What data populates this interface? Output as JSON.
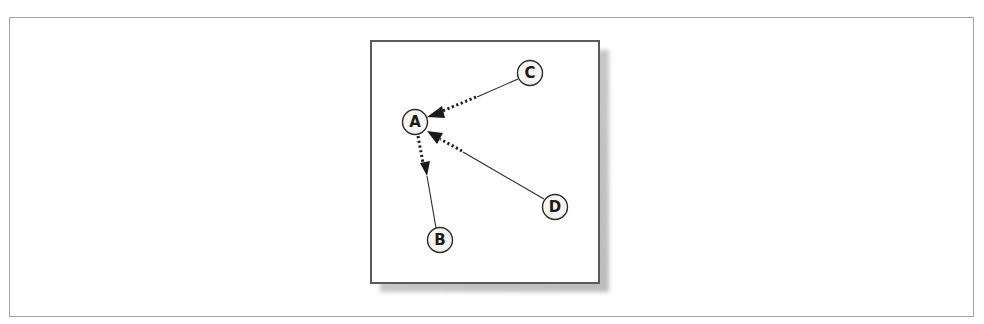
{
  "diagram": {
    "type": "directed-graph",
    "nodes": [
      {
        "id": "A",
        "label": "A",
        "cx": 415,
        "cy": 122
      },
      {
        "id": "B",
        "label": "B",
        "cx": 440,
        "cy": 240
      },
      {
        "id": "C",
        "label": "C",
        "cx": 530,
        "cy": 73
      },
      {
        "id": "D",
        "label": "D",
        "cx": 555,
        "cy": 207
      }
    ],
    "edges": [
      {
        "from": "C",
        "to": "A",
        "style": "solid-then-dotted",
        "arrow": "at A"
      },
      {
        "from": "D",
        "to": "A",
        "style": "solid-then-dotted",
        "arrow": "at A"
      },
      {
        "from": "A",
        "to": "B",
        "style": "dotted-then-solid",
        "arrow": "mid, pointing toward B"
      }
    ]
  }
}
